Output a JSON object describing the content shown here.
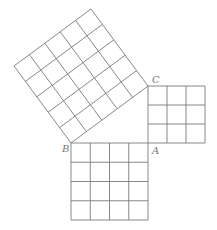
{
  "diagram": {
    "type": "pythagorean-theorem-squares",
    "points": {
      "A": {
        "label": "A",
        "x": 148,
        "y": 143
      },
      "B": {
        "label": "B",
        "x": 71,
        "y": 143
      },
      "C": {
        "label": "C",
        "x": 148,
        "y": 86
      }
    },
    "squares": [
      {
        "name": "square-on-AC",
        "side_units": 3,
        "cells": 9
      },
      {
        "name": "square-on-AB",
        "side_units": 4,
        "cells": 16
      },
      {
        "name": "square-on-BC",
        "side_units": 5,
        "cells": 25
      }
    ],
    "colors": {
      "line": "#7a7a7a",
      "label": "#777777",
      "background": "#ffffff"
    }
  }
}
